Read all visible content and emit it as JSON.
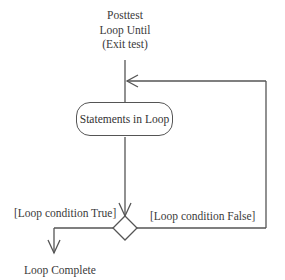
{
  "diagram": {
    "title_lines": [
      "Posttest",
      "Loop Until",
      "(Exit test)"
    ],
    "nodes": {
      "activity": "Statements in Loop",
      "decision": "decision"
    },
    "guards": {
      "true_label": "[Loop condition True]",
      "false_label": "[Loop condition False]"
    },
    "end_label": "Loop Complete",
    "colors": {
      "line": "#555555",
      "text": "#333333",
      "background": "#ffffff"
    }
  }
}
